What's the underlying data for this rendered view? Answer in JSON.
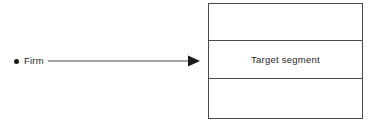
{
  "diagram": {
    "background_color": "#ffffff",
    "line_color": "#4b4b4b",
    "text_color": "#1f1f1f",
    "source_node": {
      "label": "Firm",
      "bullet": "filled-dot"
    },
    "connector": {
      "style": "solid-line-with-filled-arrowhead",
      "direction": "left-to-right"
    },
    "target_box": {
      "rows": [
        {
          "label": ""
        },
        {
          "label": "Target segment"
        },
        {
          "label": ""
        }
      ]
    }
  }
}
